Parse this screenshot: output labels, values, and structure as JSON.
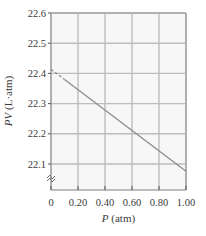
{
  "chart_data": {
    "type": "line",
    "title": "",
    "xlabel": "P (atm)",
    "xlabel_var": "P",
    "xlabel_unit": " (atm)",
    "ylabel": "PV (L·atm)",
    "ylabel_var": "PV",
    "ylabel_unit": " (L·atm)",
    "xlim": [
      0,
      1.0
    ],
    "ylim": [
      22.05,
      22.6
    ],
    "y_axis_break": true,
    "grid": true,
    "x_ticks": [
      0,
      0.2,
      0.4,
      0.6,
      0.8,
      1.0
    ],
    "x_tick_labels": [
      "0",
      "0.20",
      "0.40",
      "0.60",
      "0.80",
      "1.00"
    ],
    "y_ticks": [
      22.1,
      22.2,
      22.3,
      22.4,
      22.5,
      22.6
    ],
    "y_tick_labels": [
      "22.1",
      "22.2",
      "22.3",
      "22.4",
      "22.5",
      "22.6"
    ],
    "series": [
      {
        "name": "extrapolation",
        "style": "dashed",
        "x": [
          0,
          0.1
        ],
        "y": [
          22.414,
          22.38
        ]
      },
      {
        "name": "measured",
        "style": "solid",
        "x": [
          0.1,
          1.0
        ],
        "y": [
          22.38,
          22.076
        ]
      }
    ],
    "colors": {
      "line": "#8a8a8a",
      "grid": "#bdbdbd",
      "frame": "#a8a8a8",
      "text": "#3a3a3a"
    }
  }
}
